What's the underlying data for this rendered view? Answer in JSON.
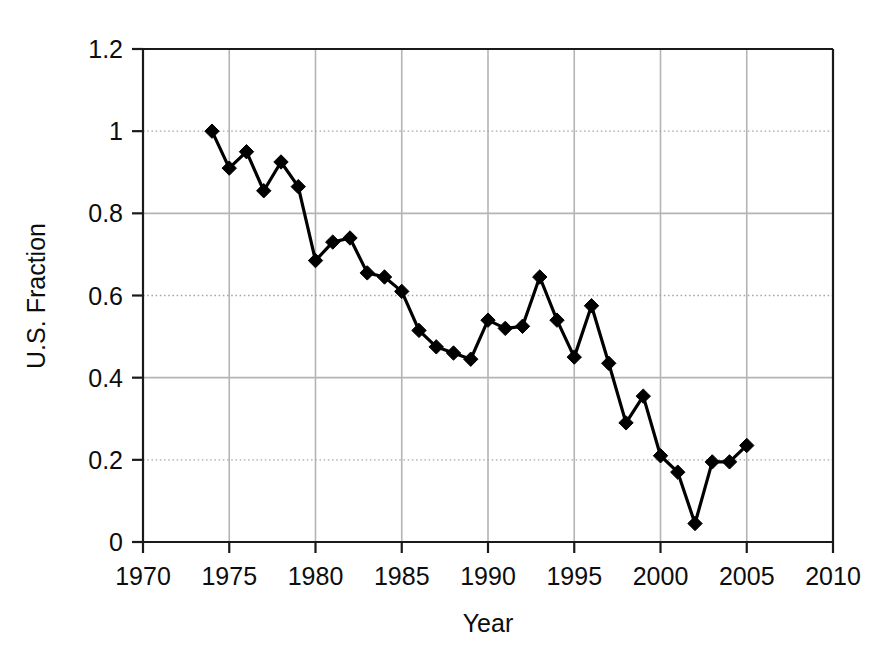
{
  "chart_data": {
    "type": "line",
    "title": "",
    "xlabel": "Year",
    "ylabel": "U.S. Fraction",
    "xlim": [
      1970,
      2010
    ],
    "ylim": [
      0,
      1.2
    ],
    "xticks": [
      1970,
      1975,
      1980,
      1985,
      1990,
      1995,
      2000,
      2005,
      2010
    ],
    "xtick_labels": [
      "1970",
      "1975",
      "1980",
      "1985",
      "1990",
      "1995",
      "2000",
      "2005",
      "2010"
    ],
    "yticks": [
      0,
      0.2,
      0.4,
      0.6,
      0.8,
      1,
      1.2
    ],
    "ytick_labels": [
      "0",
      "0.2",
      "0.4",
      "0.6",
      "0.8",
      "1",
      "1.2"
    ],
    "grid": "both",
    "legend": "none",
    "marker": "diamond",
    "marker_color": "#000000",
    "line_color": "#000000",
    "x": [
      1974,
      1975,
      1976,
      1977,
      1978,
      1979,
      1980,
      1981,
      1982,
      1983,
      1984,
      1985,
      1986,
      1987,
      1988,
      1989,
      1990,
      1991,
      1992,
      1993,
      1994,
      1995,
      1996,
      1997,
      1998,
      1999,
      2000,
      2001,
      2002,
      2003,
      2004,
      2005
    ],
    "values": [
      1.0,
      0.91,
      0.95,
      0.855,
      0.925,
      0.865,
      0.685,
      0.73,
      0.74,
      0.655,
      0.645,
      0.61,
      0.515,
      0.475,
      0.46,
      0.445,
      0.54,
      0.52,
      0.525,
      0.645,
      0.54,
      0.45,
      0.575,
      0.435,
      0.29,
      0.355,
      0.21,
      0.17,
      0.045,
      0.195,
      0.195,
      0.235
    ]
  },
  "colors": {
    "background": "#ffffff",
    "axis": "#1a1a1a",
    "gridline_solid": "#b4b4b4",
    "gridline_dotted": "#a8a8a8",
    "series": "#000000"
  }
}
